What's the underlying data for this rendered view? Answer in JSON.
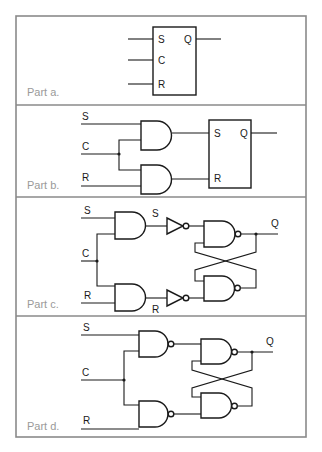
{
  "figure": {
    "panels": [
      {
        "id": "a",
        "label": "Part a.",
        "description": "SR flip-flop block symbol",
        "box_inputs": [
          "S",
          "C",
          "R"
        ],
        "box_outputs": [
          "Q"
        ]
      },
      {
        "id": "b",
        "label": "Part b.",
        "description": "Clocked SR: two AND gates gated by C feeding SR latch block",
        "signals": [
          "S",
          "C",
          "R"
        ],
        "box_inputs": [
          "S",
          "R"
        ],
        "box_outputs": [
          "Q"
        ]
      },
      {
        "id": "c",
        "label": "Part c.",
        "description": "AND gates, inverters, cross-coupled NAND latch",
        "signals": [
          "S",
          "C",
          "R"
        ],
        "internal_labels": [
          "S",
          "R"
        ],
        "output": "Q"
      },
      {
        "id": "d",
        "label": "Part d.",
        "description": "Two input NAND gates with cross-coupled NAND latch",
        "signals": [
          "S",
          "C",
          "R"
        ],
        "output": "Q"
      }
    ]
  },
  "labels": {
    "S": "S",
    "C": "C",
    "R": "R",
    "Q": "Q",
    "part_a": "Part a.",
    "part_b": "Part b.",
    "part_c": "Part c.",
    "part_d": "Part d."
  },
  "colors": {
    "frame": "#8a8a8a",
    "ink": "#1a1a1a",
    "part_label": "#9a9a9a"
  }
}
